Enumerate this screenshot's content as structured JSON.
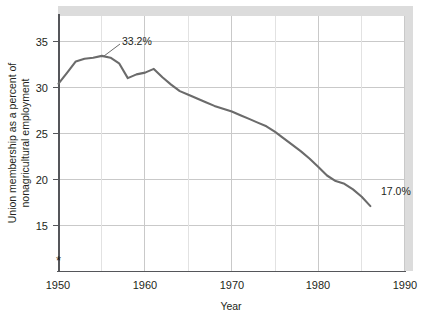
{
  "chart_data": {
    "type": "line",
    "title": "",
    "xlabel": "Year",
    "ylabel": "Union membership as a percent of nonagricultural employment",
    "ylabel_line1": "Union membership as a percent of",
    "ylabel_line2": "nonagricultural employment",
    "xlim": [
      1950,
      1990
    ],
    "ylim": [
      10,
      37.5
    ],
    "xticks": [
      1950,
      1960,
      1970,
      1980,
      1990
    ],
    "xtick_labels": [
      "1950",
      "1960",
      "1970",
      "1980",
      "1990"
    ],
    "yticks": [
      15,
      20,
      25,
      30,
      35
    ],
    "ytick_labels": [
      "15",
      "20",
      "25",
      "30",
      "35"
    ],
    "grid": true,
    "legend": "none",
    "line_color": "#6b6b6b",
    "grid_color": "#c9c9c9",
    "axis_color": "#55565a",
    "x": [
      1950,
      1951,
      1952,
      1953,
      1954,
      1955,
      1956,
      1957,
      1958,
      1959,
      1960,
      1961,
      1962,
      1963,
      1964,
      1965,
      1966,
      1967,
      1968,
      1969,
      1970,
      1971,
      1972,
      1973,
      1974,
      1975,
      1976,
      1977,
      1978,
      1979,
      1980,
      1981,
      1982,
      1983,
      1984,
      1985,
      1986
    ],
    "values": [
      30.2,
      31.4,
      32.6,
      32.9,
      33.0,
      33.2,
      33.0,
      32.4,
      30.8,
      31.2,
      31.4,
      31.8,
      30.9,
      30.1,
      29.4,
      29.0,
      28.6,
      28.2,
      27.8,
      27.5,
      27.2,
      26.8,
      26.4,
      26.0,
      25.6,
      25.0,
      24.3,
      23.6,
      22.9,
      22.1,
      21.2,
      20.3,
      19.7,
      19.4,
      18.8,
      18.0,
      17.0
    ],
    "annotations": [
      {
        "label": "33.2%",
        "x": 1955,
        "y": 33.2,
        "note": "peak value with leader line"
      },
      {
        "label": "17.0%",
        "x": 1986,
        "y": 17.0,
        "note": "end value label to the right of line end"
      }
    ],
    "markers": [
      {
        "label": "*",
        "x": 1950,
        "y": 11.4,
        "note": "asterisk footnote marker on y-axis near bottom"
      }
    ]
  }
}
